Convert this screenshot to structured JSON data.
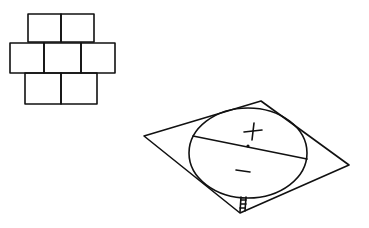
{
  "figure": {
    "stroke_color": "#111111",
    "background": "#ffffff"
  },
  "brick_grid": {
    "rows": [
      {
        "name": "top",
        "cells": 2
      },
      {
        "name": "middle",
        "cells": 3
      },
      {
        "name": "bottom",
        "cells": 2
      }
    ],
    "total_cells": 7
  },
  "rhombus_diagram": {
    "upper_region_label": "+",
    "lower_region_label": "−",
    "has_chord": true,
    "has_small_mark_at_bottom_vertex": true
  }
}
